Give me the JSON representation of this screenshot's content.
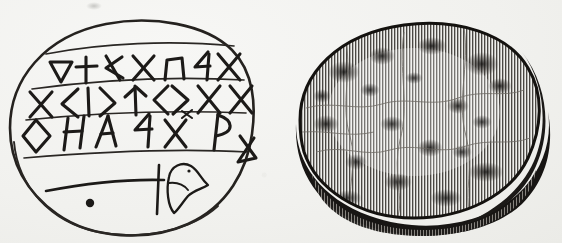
{
  "plate": {
    "caption": "",
    "background_color": "#f1f1ee",
    "ink_color": "#1c1a18",
    "figure_count": 2
  },
  "figures": [
    {
      "id": "fig-left",
      "name": "line-drawing-of-inscribed-oval-stone",
      "type": "line-drawing",
      "shape": "oval",
      "description": "Outline drawing of an oval stone bearing three ruled lines of incised runic-like characters above an engraved fish or bird figure",
      "inscription": {
        "line_count": 3,
        "ruled_lines": 4,
        "script": "runic-like angular characters",
        "rows": [
          {
            "index": 1,
            "glyph_count": 7,
            "glyphs": [
              "triangle-down",
              "cross",
              "wye-left",
              "ex",
              "arch",
              "four-like",
              "ex"
            ]
          },
          {
            "index": 2,
            "glyph_count": 8,
            "glyphs": [
              "ex",
              "angle-left",
              "vertical-bar",
              "angle-right",
              "tee-wye",
              "angle-left",
              "angle-right",
              "ex",
              "ex"
            ]
          },
          {
            "index": 3,
            "glyph_count": 8,
            "glyphs": [
              "diamond",
              "aitch",
              "lambda",
              "four-like",
              "ex-with-tick",
              "dee-reversed",
              "bowtie"
            ]
          }
        ]
      },
      "motif": {
        "name": "fish-or-bird-figure",
        "elements": [
          "long-horizontal-tail-stroke",
          "vertical-cross-stroke",
          "head-with-beak-and-eye",
          "small-round-dot"
        ]
      }
    },
    {
      "id": "fig-right",
      "name": "engraved-view-of-stone-surface",
      "type": "wood-engraving",
      "shape": "oval",
      "description": "Tonal wood-engraving of the same oval stone seen from above, rendered in fine vertical hatching with dark mottled patches and a heavy shadowed rim along the lower right edge",
      "technique": "vertical line hatching",
      "features": [
        "mottled-dark-patches",
        "surface-cracks",
        "shadowed-rim",
        "cast-shadow-bottom"
      ]
    }
  ]
}
